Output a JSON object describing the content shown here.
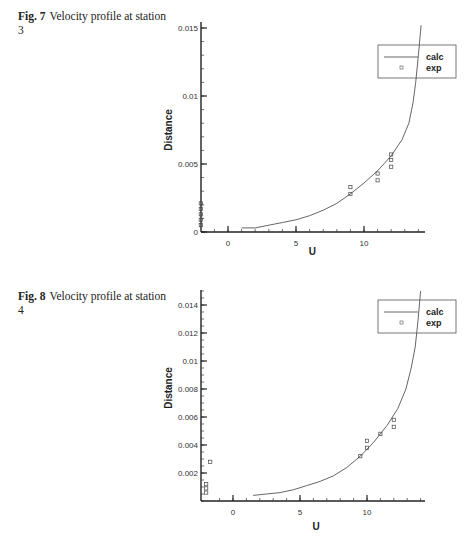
{
  "figures": [
    {
      "caption_label": "Fig. 7",
      "caption_text": "Velocity profile at station 3"
    },
    {
      "caption_label": "Fig. 8",
      "caption_text": "Velocity profile at station 4"
    }
  ],
  "chart_data": [
    {
      "type": "line",
      "title": "Fig. 7 Velocity profile at station 3",
      "xlabel": "U",
      "ylabel": "Distance",
      "xlim": [
        -2,
        14.5
      ],
      "ylim": [
        0,
        0.015
      ],
      "x_ticks": [
        0,
        5,
        10
      ],
      "y_ticks": [
        0,
        0.005,
        0.01,
        0.015
      ],
      "y_tick_labels": [
        "0",
        "0.005",
        "0.01",
        "0.015"
      ],
      "grid": false,
      "legend_position": "upper right",
      "legend": [
        "calc",
        "exp"
      ],
      "series": [
        {
          "name": "calc",
          "style": "line",
          "x": [
            1,
            2,
            3,
            4,
            5,
            6,
            7,
            8,
            9,
            10,
            11,
            12,
            12.8,
            13.3,
            13.6,
            13.8,
            14.0,
            14.2
          ],
          "y": [
            0.0003,
            0.0003,
            0.0005,
            0.0007,
            0.0009,
            0.0012,
            0.0016,
            0.0021,
            0.0028,
            0.0036,
            0.0045,
            0.0056,
            0.0068,
            0.008,
            0.0095,
            0.011,
            0.013,
            0.0152
          ]
        },
        {
          "name": "exp",
          "style": "square markers",
          "x": [
            9,
            9,
            11,
            11,
            12,
            12,
            12,
            -2,
            -2,
            -2,
            -2,
            -2
          ],
          "y": [
            0.0033,
            0.0028,
            0.0043,
            0.0038,
            0.0057,
            0.0053,
            0.0048,
            0.0005,
            0.0009,
            0.0013,
            0.0017,
            0.0021
          ]
        }
      ]
    },
    {
      "type": "line",
      "title": "Fig. 8 Velocity profile at station 4",
      "xlabel": "U",
      "ylabel": "Distance",
      "xlim": [
        -2,
        14.5
      ],
      "ylim": [
        0,
        0.015
      ],
      "x_ticks": [
        0,
        5,
        10
      ],
      "y_ticks": [
        0.002,
        0.004,
        0.006,
        0.008,
        0.01,
        0.012,
        0.014
      ],
      "y_tick_labels": [
        "0.002",
        "0.004",
        "0.006",
        "0.008",
        "0.01",
        "0.012",
        "0.014"
      ],
      "grid": false,
      "legend_position": "upper right",
      "legend": [
        "calc",
        "exp"
      ],
      "series": [
        {
          "name": "calc",
          "style": "line",
          "x": [
            1.5,
            2.5,
            3.5,
            4.5,
            5.5,
            6.5,
            7.5,
            8.5,
            9.5,
            10.5,
            11.5,
            12.3,
            12.9,
            13.3,
            13.6,
            13.8,
            14.0
          ],
          "y": [
            0.0004,
            0.0005,
            0.0006,
            0.0008,
            0.0011,
            0.0014,
            0.0018,
            0.0024,
            0.0032,
            0.0042,
            0.0054,
            0.0066,
            0.008,
            0.0095,
            0.011,
            0.0128,
            0.015
          ]
        },
        {
          "name": "exp",
          "style": "square markers",
          "x": [
            9.5,
            10,
            10,
            11,
            12,
            12,
            -1.7,
            -2,
            -2,
            -2
          ],
          "y": [
            0.0032,
            0.0038,
            0.0043,
            0.0048,
            0.0053,
            0.0058,
            0.0028,
            0.0006,
            0.0009,
            0.0012
          ]
        }
      ]
    }
  ]
}
